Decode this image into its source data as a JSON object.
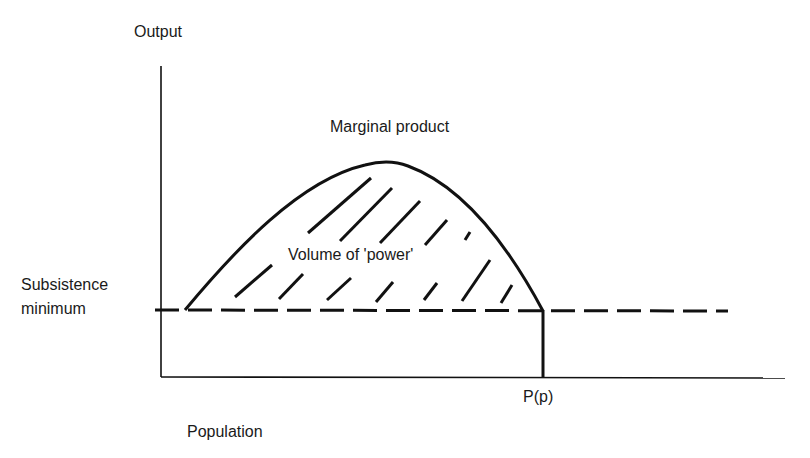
{
  "diagram": {
    "y_axis_label": "Output",
    "x_axis_label": "Population",
    "curve_label": "Marginal product",
    "area_label": "Volume of 'power'",
    "threshold_label_line1": "Subsistence",
    "threshold_label_line2": "minimum",
    "x_marker_label": "P(p)"
  },
  "colors": {
    "ink": "#111111",
    "background": "#ffffff"
  }
}
